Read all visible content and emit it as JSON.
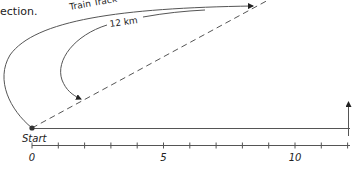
{
  "caption_fragment": "ection.",
  "labels": {
    "train_track": "Train Track",
    "distance": "12 km",
    "start": "Start"
  },
  "axis": {
    "min": 0,
    "max": 12,
    "tick_step": 1,
    "tick_labels": [
      {
        "value": 0,
        "text": "0"
      },
      {
        "value": 5,
        "text": "5"
      },
      {
        "value": 10,
        "text": "10"
      }
    ]
  },
  "colors": {
    "line": "#555555",
    "text": "#222222",
    "dot": "#333333"
  }
}
